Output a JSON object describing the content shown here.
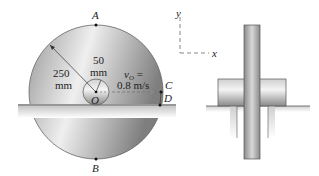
{
  "figure": {
    "points": {
      "A": "A",
      "B": "B",
      "C": "C",
      "D": "D",
      "O": "O"
    },
    "outer_radius": {
      "value": "250",
      "unit": "mm"
    },
    "hub_radius": {
      "value": "50",
      "unit": "mm"
    },
    "velocity": {
      "symbol": "v",
      "subscript": "O",
      "eq": "=",
      "value": "0.8 m/s"
    },
    "axes": {
      "x": "x",
      "y": "y"
    },
    "colors": {
      "disk_light": "#e6e6e6",
      "disk_dark": "#8c8c8c",
      "rail": "#c8c8c8",
      "text": "#222222"
    }
  }
}
